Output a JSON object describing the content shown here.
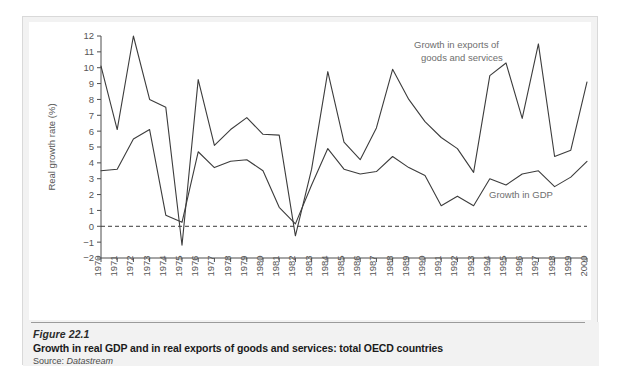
{
  "figure": {
    "number_label": "Figure 22.1",
    "title": "Growth in real GDP and in real exports of goods and services: total OECD countries",
    "source_prefix": "Source:",
    "source_name": "Datastream"
  },
  "colors": {
    "line": "#3c3c3c",
    "axis": "#4d4d4d",
    "tick_label": "#565656",
    "annotation": "#6e6e6e",
    "plot_background": "#ffffff",
    "figure_background": "#f2f2f2",
    "zero_line": "#3a3a3a"
  },
  "chart_data": {
    "type": "line",
    "title": "",
    "xlabel": "",
    "ylabel": "Real growth rate (%)",
    "ylim": [
      -2,
      12
    ],
    "ytick_step": 1,
    "yticks": [
      "12",
      "11",
      "10",
      "9",
      "8",
      "7",
      "6",
      "5",
      "4",
      "3",
      "2",
      "1",
      "0",
      "-1",
      "-2"
    ],
    "grid": false,
    "zero_reference_line": 0,
    "legend": "inline-annotations",
    "annotations": [
      {
        "name": "exports-label",
        "text_line1": "Growth in exports of",
        "text_line2": "goods and services"
      },
      {
        "name": "gdp-label",
        "text_line1": "Growth in GDP",
        "text_line2": ""
      }
    ],
    "categories": [
      "1970",
      "1971",
      "1972",
      "1973",
      "1974",
      "1975",
      "1976",
      "1977",
      "1978",
      "1979",
      "1980",
      "1981",
      "1982",
      "1983",
      "1984",
      "1985",
      "1986",
      "1987",
      "1988",
      "1989",
      "1990",
      "1991",
      "1992",
      "1993",
      "1994",
      "1995",
      "1996",
      "1997",
      "1998",
      "1999",
      "2000"
    ],
    "series": [
      {
        "name": "Growth in exports of goods and services",
        "values": [
          10.1,
          6.1,
          12.0,
          8.0,
          7.5,
          -1.2,
          9.25,
          5.1,
          6.1,
          6.85,
          5.8,
          5.75,
          -0.6,
          3.6,
          9.75,
          5.3,
          4.2,
          6.2,
          9.9,
          8.0,
          6.6,
          5.6,
          4.9,
          3.4,
          9.5,
          10.3,
          6.8,
          11.5,
          4.4,
          4.8,
          9.1
        ]
      },
      {
        "name": "Growth in GDP",
        "values": [
          3.5,
          3.6,
          5.5,
          6.1,
          0.7,
          0.25,
          4.7,
          3.7,
          4.1,
          4.2,
          3.5,
          1.2,
          0.15,
          2.6,
          4.9,
          3.6,
          3.3,
          3.45,
          4.4,
          3.7,
          3.2,
          1.3,
          1.9,
          1.3,
          3.0,
          2.6,
          3.3,
          3.5,
          2.5,
          3.1,
          4.1
        ]
      }
    ]
  }
}
